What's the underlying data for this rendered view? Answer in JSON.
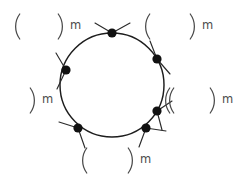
{
  "figure": {
    "background_color": "#ffffff",
    "stroke_color": "#1d1d1d",
    "dot_color": "#111111",
    "bracket_color": "#4a4a4a",
    "width": 240,
    "height": 177
  },
  "ring": {
    "name": "macrocycle-ring",
    "center_x": 112,
    "center_y": 85,
    "radius": 52,
    "vertex_count": 6
  },
  "vertices": [
    {
      "id": "vertex-top",
      "label": "top vertex",
      "cx": 112,
      "cy": 33,
      "r": 4.6,
      "angle_deg": 90
    },
    {
      "id": "vertex-upper-right",
      "label": "upper right vertex",
      "cx": 157,
      "cy": 59,
      "r": 4.6,
      "angle_deg": 30
    },
    {
      "id": "vertex-lower-right",
      "label": "lower right vertex",
      "cx": 157,
      "cy": 111,
      "r": 4.6,
      "angle_deg": -30
    },
    {
      "id": "vertex-bottom-right",
      "label": "bottom right vertex",
      "cx": 146,
      "cy": 128,
      "r": 4.6,
      "angle_deg": -55
    },
    {
      "id": "vertex-bottom-left",
      "label": "bottom left vertex",
      "cx": 78,
      "cy": 128,
      "r": 4.6,
      "angle_deg": -125
    },
    {
      "id": "vertex-left",
      "label": "left vertex",
      "cx": 66,
      "cy": 70,
      "r": 4.6,
      "angle_deg": 150
    }
  ],
  "repeat_units": [
    {
      "id": "unit-top-left",
      "position": "top-left",
      "open_bracket": "(",
      "close_bracket": ")",
      "subscript": "m",
      "text": "( ) m",
      "open_x": 18,
      "close_x": 60,
      "y": 14,
      "bracket_height": 25,
      "label_x": 70,
      "label_y": 20
    },
    {
      "id": "unit-top-right",
      "position": "top-right",
      "open_bracket": "(",
      "close_bracket": ")",
      "subscript": "m",
      "text": "( ) m",
      "open_x": 148,
      "close_x": 192,
      "y": 14,
      "bracket_height": 25,
      "label_x": 202,
      "label_y": 20
    },
    {
      "id": "unit-middle-left",
      "position": "middle-left",
      "open_bracket": "",
      "close_bracket": ")",
      "subscript": "m",
      "text": ") m",
      "open_x": null,
      "close_x": 32,
      "y": 88,
      "bracket_height": 25,
      "label_x": 42,
      "label_y": 94
    },
    {
      "id": "unit-middle-right",
      "position": "middle-right",
      "open_bracket": "(",
      "close_bracket": ")",
      "subscript": "m",
      "text": "( ) m",
      "open_x": 172,
      "close_x": 212,
      "y": 88,
      "bracket_height": 25,
      "label_x": 222,
      "label_y": 94
    },
    {
      "id": "unit-inner-left",
      "position": "inner-left",
      "open_bracket": "(",
      "close_bracket": "",
      "subscript": "",
      "text": "(",
      "open_x": 168,
      "close_x": null,
      "y": 88,
      "bracket_height": 25,
      "label_x": null,
      "label_y": null
    },
    {
      "id": "unit-bottom",
      "position": "bottom",
      "open_bracket": "(",
      "close_bracket": ")",
      "subscript": "m",
      "text": "( ) m",
      "open_x": 85,
      "close_x": 130,
      "y": 148,
      "bracket_height": 25,
      "label_x": 140,
      "label_y": 154
    }
  ],
  "whiskers": [
    {
      "id": "whisker-top-a",
      "x1": 112,
      "y1": 33,
      "x2": 95,
      "y2": 23
    },
    {
      "id": "whisker-top-b",
      "x1": 112,
      "y1": 33,
      "x2": 130,
      "y2": 23
    },
    {
      "id": "whisker-left-a",
      "x1": 66,
      "y1": 70,
      "x2": 56,
      "y2": 53
    },
    {
      "id": "whisker-left-b",
      "x1": 66,
      "y1": 70,
      "x2": 57,
      "y2": 89
    },
    {
      "id": "whisker-upper-right-a",
      "x1": 157,
      "y1": 59,
      "x2": 150,
      "y2": 41
    },
    {
      "id": "whisker-upper-right-b",
      "x1": 157,
      "y1": 59,
      "x2": 170,
      "y2": 74
    },
    {
      "id": "whisker-lower-right-a",
      "x1": 157,
      "y1": 111,
      "x2": 172,
      "y2": 101
    },
    {
      "id": "whisker-lower-right-b",
      "x1": 157,
      "y1": 111,
      "x2": 162,
      "y2": 130
    },
    {
      "id": "whisker-bottom-right-a",
      "x1": 146,
      "y1": 128,
      "x2": 166,
      "y2": 131
    },
    {
      "id": "whisker-bottom-right-b",
      "x1": 146,
      "y1": 128,
      "x2": 139,
      "y2": 147
    },
    {
      "id": "whisker-bottom-left-a",
      "x1": 78,
      "y1": 128,
      "x2": 59,
      "y2": 122
    },
    {
      "id": "whisker-bottom-left-b",
      "x1": 78,
      "y1": 128,
      "x2": 85,
      "y2": 148
    }
  ]
}
